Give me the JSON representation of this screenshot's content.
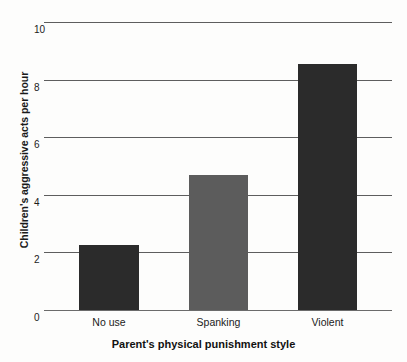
{
  "chart_data": {
    "type": "bar",
    "title": "",
    "categories": [
      "No use",
      "Spanking",
      "Violent"
    ],
    "values": [
      2.25,
      4.7,
      8.55
    ],
    "series": [
      {
        "name": "Children's aggressive acts per hour",
        "values": [
          2.25,
          4.7,
          8.55
        ]
      }
    ],
    "xlabel": "Parent's physical punishment style",
    "ylabel": "Children's aggressive acts per hour",
    "ylim": [
      0,
      10
    ],
    "ytick_labels": [
      "0",
      "2",
      "4",
      "6",
      "8",
      "10"
    ],
    "ytick_values": [
      0,
      2,
      4,
      6,
      8,
      10
    ],
    "grid": "horizontal",
    "legend": "none",
    "bar_colors": [
      "#2b2b2b",
      "#5c5c5c",
      "#2b2b2b"
    ],
    "gridline_color": "#5e5e5e",
    "background_color": "#fdfdfc",
    "text_color": "#1b1b1b"
  },
  "axes": {
    "y_title": "Children's aggressive acts per hour",
    "x_title": "Parent's physical punishment style",
    "y_ticks": [
      {
        "label": "10",
        "value": 10
      },
      {
        "label": "8",
        "value": 8
      },
      {
        "label": "6",
        "value": 6
      },
      {
        "label": "4",
        "value": 4
      },
      {
        "label": "2",
        "value": 2
      },
      {
        "label": "0",
        "value": 0
      }
    ],
    "x_ticks": [
      {
        "label": "No use"
      },
      {
        "label": "Spanking"
      },
      {
        "label": "Violent"
      }
    ]
  },
  "bars": [
    {
      "category": "No use",
      "value": 2.25,
      "color": "#2b2b2b"
    },
    {
      "category": "Spanking",
      "value": 4.7,
      "color": "#5c5c5c"
    },
    {
      "category": "Violent",
      "value": 8.55,
      "color": "#2b2b2b"
    }
  ]
}
